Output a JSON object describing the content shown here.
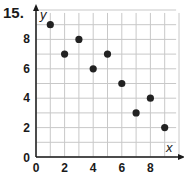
{
  "problem": {
    "number": "15."
  },
  "chart_data": {
    "type": "scatter",
    "title": "",
    "xlabel": "x",
    "ylabel": "y",
    "x": [
      1,
      2,
      3,
      4,
      5,
      6,
      7,
      8,
      9
    ],
    "y": [
      9,
      7,
      8,
      6,
      7,
      5,
      3,
      4,
      2
    ],
    "points": [
      {
        "x": 1,
        "y": 9
      },
      {
        "x": 2,
        "y": 7
      },
      {
        "x": 3,
        "y": 8
      },
      {
        "x": 4,
        "y": 6
      },
      {
        "x": 5,
        "y": 7
      },
      {
        "x": 6,
        "y": 5
      },
      {
        "x": 7,
        "y": 3
      },
      {
        "x": 8,
        "y": 4
      },
      {
        "x": 9,
        "y": 2
      }
    ],
    "xticks": [
      "0",
      "2",
      "4",
      "6",
      "8"
    ],
    "yticks": [
      "0",
      "2",
      "4",
      "6",
      "8"
    ],
    "xlim": [
      0,
      10
    ],
    "ylim": [
      0,
      10
    ],
    "grid": true,
    "legend": null,
    "colors": {
      "point": "#222222",
      "grid": "#c8c8c8",
      "axis": "#1a1a1a"
    }
  }
}
